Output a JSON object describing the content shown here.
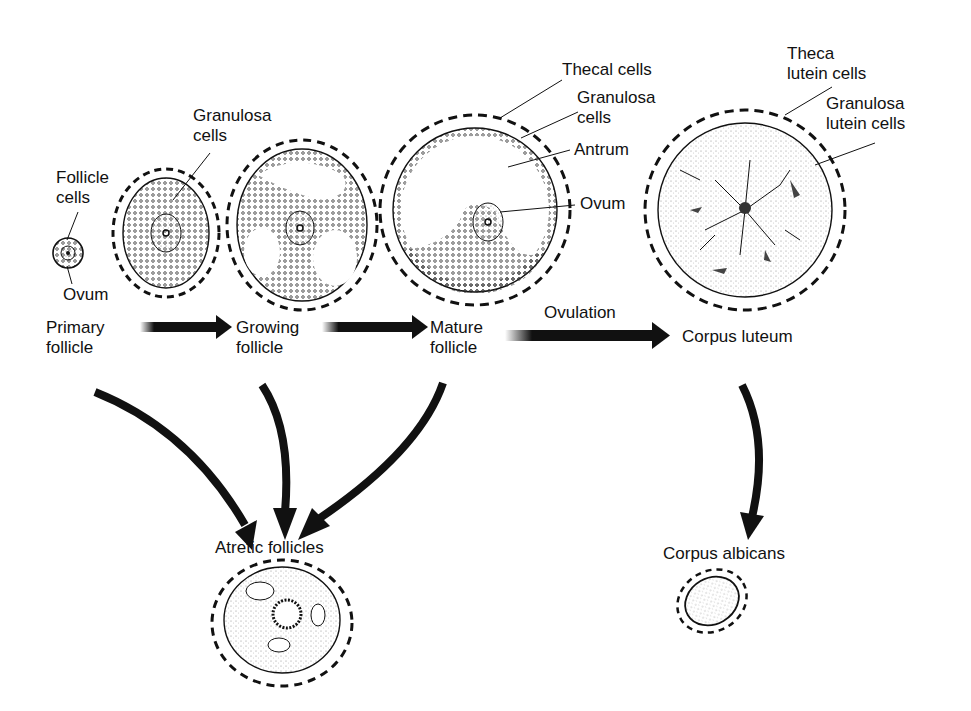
{
  "diagram": {
    "stages": {
      "primary": {
        "line1": "Primary",
        "line2": "follicle"
      },
      "growing": {
        "line1": "Growing",
        "line2": "follicle"
      },
      "mature": {
        "line1": "Mature",
        "line2": "follicle"
      },
      "corpus_luteum": {
        "label": "Corpus luteum"
      },
      "atretic": {
        "label": "Atretic follicles"
      },
      "corpus_albicans": {
        "label": "Corpus albicans"
      }
    },
    "transitions": {
      "ovulation": "Ovulation"
    },
    "annotations": {
      "follicle_cells": {
        "line1": "Follicle",
        "line2": "cells"
      },
      "ovum_primary": "Ovum",
      "granulosa_cells_growing": {
        "line1": "Granulosa",
        "line2": "cells"
      },
      "thecal_cells": "Thecal cells",
      "granulosa_cells_mature": {
        "line1": "Granulosa",
        "line2": "cells"
      },
      "antrum": "Antrum",
      "ovum_mature": "Ovum",
      "theca_lutein": {
        "line1": "Theca",
        "line2": "lutein cells"
      },
      "granulosa_lutein": {
        "line1": "Granulosa",
        "line2": "lutein cells"
      }
    },
    "colors": {
      "ink": "#111111",
      "background": "#ffffff",
      "stipple": "#888888"
    }
  }
}
